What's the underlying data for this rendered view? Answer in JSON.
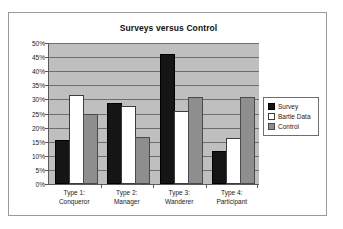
{
  "chart_data": {
    "type": "bar",
    "title": "Surveys versus Control",
    "xlabel": "",
    "ylabel": "",
    "ylim": [
      0,
      50
    ],
    "ytick_labels": [
      "50%",
      "45%",
      "40%",
      "35%",
      "30%",
      "25%",
      "20%",
      "15%",
      "10%",
      "5%",
      "0%"
    ],
    "ytick_values": [
      50,
      45,
      40,
      35,
      30,
      25,
      20,
      15,
      10,
      5,
      0
    ],
    "grid": true,
    "legend_position": "right",
    "categories": [
      "Type 1:\nConqueror",
      "Type 2:\nManager",
      "Type 3:\nWanderer",
      "Type 4:\nParticipant"
    ],
    "category_lines": [
      [
        "Type 1:",
        "Conqueror"
      ],
      [
        "Type 2:",
        "Manager"
      ],
      [
        "Type 3:",
        "Wanderer"
      ],
      [
        "Type 4:",
        "Participant"
      ]
    ],
    "series": [
      {
        "name": "Survey",
        "color": "#151515",
        "values": [
          15,
          28,
          45.5,
          11
        ]
      },
      {
        "name": "Bartle Data",
        "color": "#ffffff",
        "values": [
          31,
          27,
          25,
          15.5
        ]
      },
      {
        "name": "Control",
        "color": "#8e8e8e",
        "values": [
          24,
          16,
          30,
          30
        ]
      }
    ]
  },
  "legend": {
    "items": [
      {
        "label": "Survey"
      },
      {
        "label": "Bartle Data"
      },
      {
        "label": "Control"
      }
    ]
  },
  "colors": {
    "plot_background": "#bfbfbf",
    "figure_background": "#ffffff",
    "gridline": "#6e6e6e",
    "axis": "#5a5a5a",
    "border": "#9a9a9a"
  }
}
